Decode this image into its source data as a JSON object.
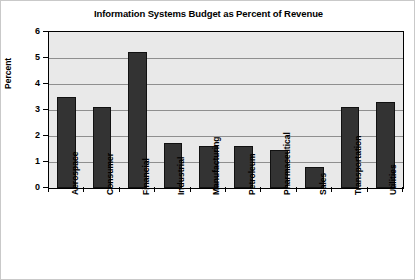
{
  "chart_data": {
    "type": "bar",
    "title": "Information Systems Budget as Percent of Revenue",
    "xlabel": "",
    "ylabel": "Percent",
    "ylim": [
      0,
      6
    ],
    "yticks": [
      0,
      1,
      2,
      3,
      4,
      5,
      6
    ],
    "ytick_labels": [
      "0",
      "1",
      "2",
      "3",
      "4",
      "5",
      "6"
    ],
    "grid": true,
    "legend": "none",
    "categories": [
      "Aerospace",
      "Consumer",
      "Financial",
      "Industrial",
      "Manufacturing",
      "Petroleum",
      "Pharmaceutical",
      "Sales",
      "Transportation",
      "Utilities"
    ],
    "values": [
      3.5,
      3.1,
      5.25,
      1.75,
      1.6,
      1.6,
      1.45,
      0.8,
      3.1,
      3.3
    ],
    "colors": {
      "bar": "#333333",
      "plot_background": "#e9e9e9",
      "gridline": "#8f8f8f",
      "axis": "#000000",
      "figure_background": "#ffffff"
    }
  }
}
